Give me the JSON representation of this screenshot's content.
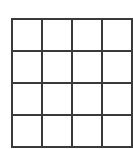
{
  "figure": {
    "type": "grid",
    "rows": 4,
    "columns": 4,
    "cell_count": 16,
    "cell_label": "",
    "cells": [
      [
        "",
        "",
        "",
        ""
      ],
      [
        "",
        "",
        "",
        ""
      ],
      [
        "",
        "",
        "",
        ""
      ],
      [
        "",
        "",
        "",
        ""
      ]
    ],
    "geometry": {
      "left": 11,
      "top": 18,
      "right": 124,
      "bottom": 139,
      "width": 113,
      "height": 121,
      "column_width": 28,
      "row_height": 30,
      "vertical_line_positions": [
        11,
        39,
        67,
        95,
        123
      ],
      "horizontal_line_positions": [
        18,
        48,
        78,
        108,
        138
      ]
    },
    "style": {
      "line_color": "#3a3a3a",
      "line_width_px": 2,
      "cell_fill": "#ffffff",
      "page_background": "#ffffff"
    }
  }
}
